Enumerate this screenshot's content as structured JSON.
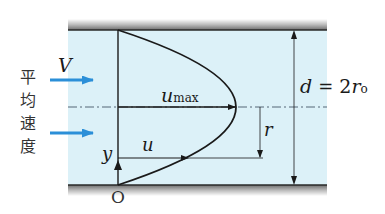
{
  "diagram": {
    "side_label_chars": [
      "平",
      "均",
      "速",
      "度"
    ],
    "labels": {
      "mean_velocity": "V",
      "max_velocity_base": "u",
      "max_velocity_sub": "max",
      "local_velocity": "u",
      "radius": "r",
      "y_axis": "y",
      "origin": "O",
      "diameter_lhs": "d",
      "diameter_eq": "=",
      "diameter_rhs_coef": "2",
      "diameter_rhs_var": "r",
      "diameter_rhs_sub": "o"
    },
    "colors": {
      "fluid": "#dcf1f8",
      "wall": "#8a8a8a",
      "wall_edge": "#2a2a2a",
      "line": "#1a1a1a",
      "arrow_blue": "#2b8fd8",
      "centerline": "#556677"
    }
  }
}
